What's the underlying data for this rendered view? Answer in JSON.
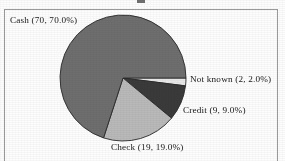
{
  "frame": {
    "border_color": "#9a9a9a",
    "background": "#fdfdfd"
  },
  "title_remnant": "",
  "chart_data": {
    "type": "pie",
    "title": "",
    "subtitle": "",
    "xlabel": "",
    "ylabel": "",
    "legend_position": "none",
    "grid": false,
    "label_format": "name (count, percent)",
    "total": 100,
    "start_angle_deg": 0,
    "direction": "clockwise",
    "categories": [
      "Not known",
      "Credit",
      "Check",
      "Cash"
    ],
    "values": [
      2,
      9,
      19,
      70
    ],
    "percents": [
      2.0,
      9.0,
      19.0,
      70.0
    ],
    "colors": [
      "#e8e8e8",
      "#3a3a3a",
      "#b9b9b9",
      "#6e6e6e"
    ],
    "slices": [
      {
        "name": "Not known",
        "count": 2,
        "percent": 2.0,
        "color": "#e8e8e8",
        "label": "Not known (2, 2.0%)",
        "start_angle_deg": 0,
        "end_angle_deg": 7.2
      },
      {
        "name": "Credit",
        "count": 9,
        "percent": 9.0,
        "color": "#3a3a3a",
        "label": "Credit (9, 9.0%)",
        "start_angle_deg": 7.2,
        "end_angle_deg": 39.6
      },
      {
        "name": "Check",
        "count": 19,
        "percent": 19.0,
        "color": "#b9b9b9",
        "label": "Check (19, 19.0%)",
        "start_angle_deg": 39.6,
        "end_angle_deg": 108.0
      },
      {
        "name": "Cash",
        "count": 70,
        "percent": 70.0,
        "color": "#6e6e6e",
        "label": "Cash (70, 70.0%)",
        "start_angle_deg": 108.0,
        "end_angle_deg": 360.0
      }
    ],
    "geometry": {
      "center_x": 123,
      "center_y": 78,
      "radius": 63,
      "outline_color": "#2a2a2a"
    }
  }
}
